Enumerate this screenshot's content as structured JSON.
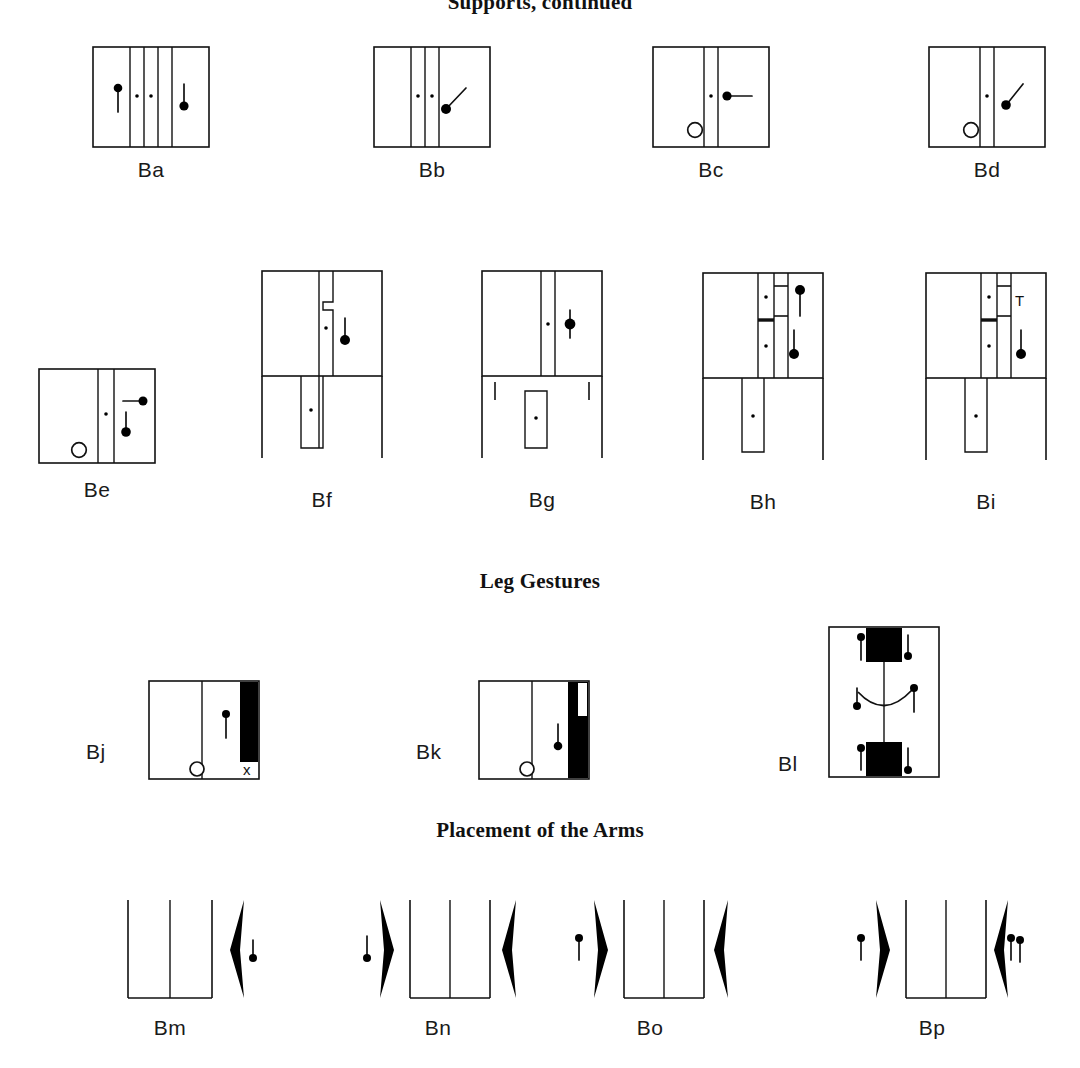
{
  "page": {
    "background_color": "#ffffff",
    "ink_color": "#111111",
    "width": 1080,
    "height": 1068
  },
  "headings": [
    {
      "id": "heading-top",
      "text": "Supports, continued",
      "clipped": true
    },
    {
      "id": "heading-leg",
      "text": "Leg Gestures",
      "clipped": false
    },
    {
      "id": "heading-arms",
      "text": "Placement of the Arms",
      "clipped": false
    }
  ],
  "rows": [
    {
      "name": "supports-row-1",
      "figures": [
        {
          "label": "Ba",
          "label_position": "below"
        },
        {
          "label": "Bb",
          "label_position": "below"
        },
        {
          "label": "Bc",
          "label_position": "below"
        },
        {
          "label": "Bd",
          "label_position": "below"
        }
      ]
    },
    {
      "name": "supports-row-2",
      "figures": [
        {
          "label": "Be",
          "label_position": "below"
        },
        {
          "label": "Bf",
          "label_position": "below"
        },
        {
          "label": "Bg",
          "label_position": "below"
        },
        {
          "label": "Bh",
          "label_position": "below"
        },
        {
          "label": "Bi",
          "label_position": "below"
        }
      ]
    },
    {
      "name": "leg-gestures-row",
      "figures": [
        {
          "label": "Bj",
          "label_position": "left"
        },
        {
          "label": "Bk",
          "label_position": "left"
        },
        {
          "label": "Bl",
          "label_position": "left"
        }
      ]
    },
    {
      "name": "placement-of-arms-row",
      "figures": [
        {
          "label": "Bm",
          "label_position": "below"
        },
        {
          "label": "Bn",
          "label_position": "below"
        },
        {
          "label": "Bo",
          "label_position": "below"
        },
        {
          "label": "Bp",
          "label_position": "below"
        }
      ]
    }
  ],
  "glyphs": {
    "hold_circle": "o",
    "cancel_x": "x",
    "t_sign": "T"
  },
  "labels": {
    "Ba": "Ba",
    "Bb": "Bb",
    "Bc": "Bc",
    "Bd": "Bd",
    "Be": "Be",
    "Bf": "Bf",
    "Bg": "Bg",
    "Bh": "Bh",
    "Bi": "Bi",
    "Bj": "Bj",
    "Bk": "Bk",
    "Bl": "Bl",
    "Bm": "Bm",
    "Bn": "Bn",
    "Bo": "Bo",
    "Bp": "Bp"
  }
}
